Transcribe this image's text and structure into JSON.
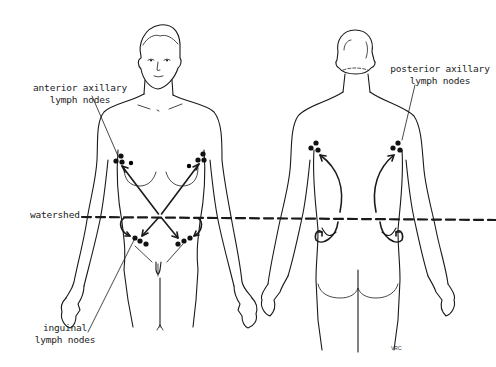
{
  "diagram": {
    "views": [
      "anterior view",
      "posterior view"
    ],
    "labels": {
      "anterior_axillary": [
        "anterior axillary",
        "lymph nodes"
      ],
      "posterior_axillary": [
        "posterior axillary",
        "lymph nodes"
      ],
      "watershed": "watershed",
      "inguinal": [
        "inguinal",
        "lymph nodes"
      ]
    },
    "signature": "VRC",
    "colors": {
      "line": "#1a1a1a",
      "background": "#ffffff"
    }
  }
}
